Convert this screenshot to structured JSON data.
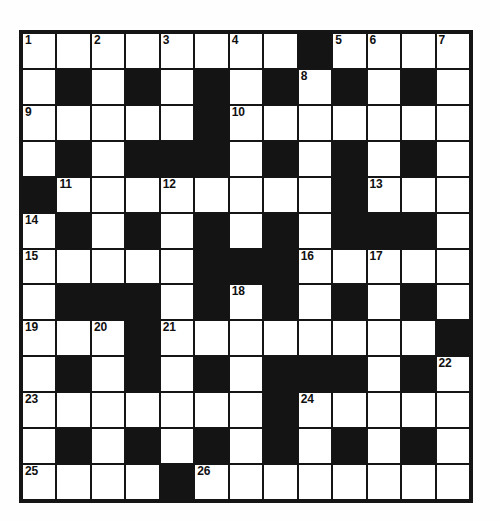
{
  "puzzle": {
    "type": "crossword-grid",
    "rows": 13,
    "columns": 13,
    "colors": {
      "page_background": "#ffffff",
      "grid_line": "#151515",
      "block_fill": "#141414",
      "open_cell_fill": "#ffffff",
      "number_text": "#101010"
    },
    "highest_clue_number": 26,
    "grid": [
      [
        "open",
        "open",
        "open",
        "open",
        "open",
        "open",
        "open",
        "open",
        "block",
        "open",
        "open",
        "open",
        "open"
      ],
      [
        "open",
        "block",
        "open",
        "block",
        "open",
        "block",
        "open",
        "block",
        "open",
        "block",
        "open",
        "block",
        "open"
      ],
      [
        "open",
        "open",
        "open",
        "open",
        "open",
        "block",
        "open",
        "open",
        "open",
        "open",
        "open",
        "open",
        "open"
      ],
      [
        "open",
        "block",
        "open",
        "block",
        "block",
        "block",
        "open",
        "block",
        "open",
        "block",
        "open",
        "block",
        "open"
      ],
      [
        "block",
        "open",
        "open",
        "open",
        "open",
        "open",
        "open",
        "open",
        "open",
        "block",
        "open",
        "open",
        "open"
      ],
      [
        "open",
        "block",
        "open",
        "block",
        "open",
        "block",
        "open",
        "block",
        "open",
        "block",
        "block",
        "block",
        "open"
      ],
      [
        "open",
        "open",
        "open",
        "open",
        "open",
        "block",
        "block",
        "block",
        "open",
        "open",
        "open",
        "open",
        "open"
      ],
      [
        "open",
        "block",
        "block",
        "block",
        "open",
        "block",
        "open",
        "block",
        "open",
        "block",
        "open",
        "block",
        "open"
      ],
      [
        "open",
        "open",
        "open",
        "block",
        "open",
        "open",
        "open",
        "open",
        "open",
        "open",
        "open",
        "open",
        "block"
      ],
      [
        "open",
        "block",
        "open",
        "block",
        "open",
        "block",
        "open",
        "block",
        "block",
        "block",
        "open",
        "block",
        "open"
      ],
      [
        "open",
        "open",
        "open",
        "open",
        "open",
        "open",
        "open",
        "block",
        "open",
        "open",
        "open",
        "open",
        "open"
      ],
      [
        "open",
        "block",
        "open",
        "block",
        "open",
        "block",
        "open",
        "block",
        "open",
        "block",
        "open",
        "block",
        "open"
      ],
      [
        "open",
        "open",
        "open",
        "open",
        "block",
        "open",
        "open",
        "open",
        "open",
        "open",
        "open",
        "open",
        "open"
      ]
    ],
    "numbers": [
      {
        "number": 1,
        "row": 1,
        "col": 1
      },
      {
        "number": 2,
        "row": 1,
        "col": 3
      },
      {
        "number": 3,
        "row": 1,
        "col": 5
      },
      {
        "number": 4,
        "row": 1,
        "col": 7
      },
      {
        "number": 5,
        "row": 1,
        "col": 10
      },
      {
        "number": 6,
        "row": 1,
        "col": 11
      },
      {
        "number": 7,
        "row": 1,
        "col": 13
      },
      {
        "number": 8,
        "row": 2,
        "col": 9
      },
      {
        "number": 9,
        "row": 3,
        "col": 1
      },
      {
        "number": 10,
        "row": 3,
        "col": 7
      },
      {
        "number": 11,
        "row": 5,
        "col": 2
      },
      {
        "number": 12,
        "row": 5,
        "col": 5
      },
      {
        "number": 13,
        "row": 5,
        "col": 11
      },
      {
        "number": 14,
        "row": 6,
        "col": 1
      },
      {
        "number": 15,
        "row": 7,
        "col": 1
      },
      {
        "number": 16,
        "row": 7,
        "col": 9
      },
      {
        "number": 17,
        "row": 7,
        "col": 11
      },
      {
        "number": 18,
        "row": 8,
        "col": 7
      },
      {
        "number": 19,
        "row": 9,
        "col": 1
      },
      {
        "number": 20,
        "row": 9,
        "col": 3
      },
      {
        "number": 21,
        "row": 9,
        "col": 5
      },
      {
        "number": 22,
        "row": 10,
        "col": 13
      },
      {
        "number": 23,
        "row": 11,
        "col": 1
      },
      {
        "number": 24,
        "row": 11,
        "col": 9
      },
      {
        "number": 25,
        "row": 13,
        "col": 1
      },
      {
        "number": 26,
        "row": 13,
        "col": 6
      }
    ],
    "entries": []
  }
}
